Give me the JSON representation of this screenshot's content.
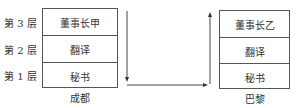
{
  "floors": [
    {
      "label": "第 3 层"
    },
    {
      "label": "第 2 层"
    },
    {
      "label": "第 1 层"
    }
  ],
  "left_building": {
    "city": "成都",
    "rows": [
      "董事长甲",
      "翻译",
      "秘书"
    ]
  },
  "right_building": {
    "city": "巴黎",
    "rows": [
      "董事长乙",
      "翻译",
      "秘书"
    ]
  }
}
